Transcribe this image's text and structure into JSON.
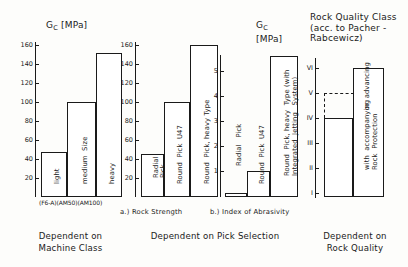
{
  "figure": {
    "panels": [
      {
        "id": "machine-class",
        "title": "G<sub>C</sub> [MPa]",
        "title_main": "G",
        "title_sub": "C",
        "title_unit": " [MPa]",
        "caption": "Dependent   on\nMachine   Class",
        "machine_codes": "(F6-A)(AM50)(AM100)",
        "axis": {
          "ticks": [
            20,
            40,
            60,
            80,
            100,
            120,
            140,
            160
          ],
          "min": 0,
          "max": 170
        },
        "bars": [
          {
            "label": "light",
            "value": 47
          },
          {
            "label": "medium  Size",
            "value": 100
          },
          {
            "label": "heavy",
            "value": 152
          }
        ]
      },
      {
        "id": "rock-strength",
        "title_main": "G",
        "title_sub": "C",
        "title_unit": " [MPa]",
        "subcaption": "a.)   Rock  Strength",
        "axis": {
          "ticks": [
            20,
            40,
            60,
            80,
            100,
            120,
            140,
            160
          ],
          "min": 0,
          "max": 170
        },
        "bars": [
          {
            "label": "Radial\nPick",
            "value": 45
          },
          {
            "label": "Round  Pick  U47",
            "value": 100
          },
          {
            "label": "Round  Pick, heavy Type",
            "value": 160
          }
        ]
      },
      {
        "id": "index-of-abrasivity",
        "title": "Index of Abrasivity\n(acc. to Schimazek)",
        "subcaption": "b.)  Index of Abrasivity",
        "axis": {
          "ticks": [
            1,
            2,
            3,
            4,
            5
          ],
          "min": 0,
          "max": 6
        },
        "bars": [
          {
            "label": "Radial   Pick",
            "value": 0.12
          },
          {
            "label": "Round  Pick  U47",
            "value": 1.0
          },
          {
            "label": "Round  Pick, heavy  Type (with\nIntegrated  Jetting   System)",
            "value": 5.6
          }
        ]
      },
      {
        "id": "rock-quality-class",
        "title": "Rock Quality Class\n(acc. to Pacher -\nRabcewicz)",
        "caption": "Dependent   on\nRock  Quality",
        "axis": {
          "ticks": [
            "I",
            "II",
            "III",
            "IV",
            "V",
            "VI"
          ],
          "min": 1,
          "max": 6.6
        },
        "bars": [
          {
            "label": "with  accompanying\nRock  Protection",
            "value": 4,
            "dashed_to": 5
          },
          {
            "label": "or  advancing",
            "value": 6
          }
        ]
      }
    ],
    "captions": {
      "machine": "Dependent   on\nMachine   Class",
      "pick": "Dependent   on  Pick  Selection",
      "rock": "Dependent   on\nRock  Quality"
    }
  }
}
